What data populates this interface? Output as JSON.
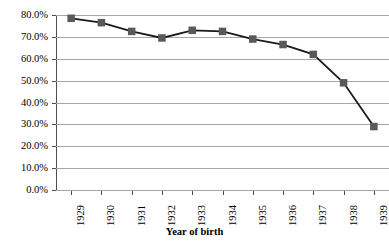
{
  "chart_data": {
    "type": "line",
    "title": "",
    "xlabel": "Year of birth",
    "ylabel": "",
    "categories": [
      "1929",
      "1930",
      "1931",
      "1932",
      "1933",
      "1934",
      "1935",
      "1936",
      "1937",
      "1938",
      "1939"
    ],
    "values": [
      78.5,
      76.5,
      72.5,
      69.5,
      73.0,
      72.5,
      69.0,
      66.5,
      62.0,
      49.0,
      29.0
    ],
    "series": [
      {
        "name": "",
        "values": [
          78.5,
          76.5,
          72.5,
          69.5,
          73.0,
          72.5,
          69.0,
          66.5,
          62.0,
          49.0,
          29.0
        ]
      }
    ],
    "ylim": [
      0,
      80
    ],
    "ytick_values": [
      0,
      10,
      20,
      30,
      40,
      50,
      60,
      70,
      80
    ],
    "ytick_labels": [
      "0.0%",
      "10.0%",
      "20.0%",
      "30.0%",
      "40.0%",
      "50.0%",
      "60.0%",
      "70.0%",
      "80.0%"
    ],
    "grid": true,
    "grid_axis": "y",
    "legend": false,
    "legend_position": "none",
    "marker": "square",
    "line_color": "#1a1a1a",
    "marker_color": "#595959",
    "grid_color": "#a6a6a6",
    "axis_color": "#4d4d4d"
  },
  "axes": {
    "x_title": "Year of birth"
  },
  "header": {
    "clipped_title": ""
  }
}
